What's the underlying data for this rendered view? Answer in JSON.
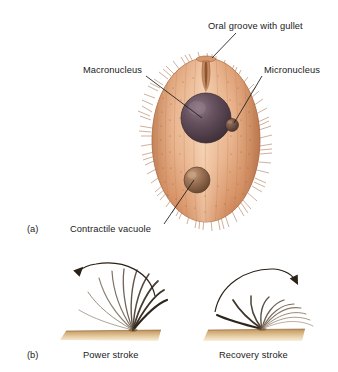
{
  "figure": {
    "background_color": "#ffffff",
    "width": 338,
    "height": 372
  },
  "panel_a": {
    "tag": "(a)",
    "subject": "paramecium-cell",
    "labels": [
      {
        "id": "oral-groove",
        "text": "Oral groove with gullet",
        "x": 208,
        "y": 28
      },
      {
        "id": "macronucleus",
        "text": "Macronucleus",
        "x": 83,
        "y": 72
      },
      {
        "id": "micronucleus",
        "text": "Micronucleus",
        "x": 264,
        "y": 72
      },
      {
        "id": "contractile-vacuole",
        "text": "Contractile vacuole",
        "x": 70,
        "y": 231
      }
    ],
    "organelles": {
      "macronucleus_color": "#574453",
      "micronucleus_color": "#6b4f45",
      "contractile_vacuole_color": "#8e6a52",
      "body_color_edge": "#c4794f",
      "body_color_center": "#eebb96",
      "cilia_color": "#b07a52"
    }
  },
  "panel_b": {
    "tag": "(b)",
    "captions": [
      {
        "id": "power-stroke",
        "text": "Power stroke",
        "x": 115,
        "y": 357
      },
      {
        "id": "recovery-stroke",
        "text": "Recovery stroke",
        "x": 256,
        "y": 357
      }
    ],
    "substrate_color": "#c2995f",
    "arrow_color": "#2a2118",
    "cilium_color": "#6e5844",
    "stroke_directions": {
      "power": "counterclockwise-leftward",
      "recovery": "clockwise-rightward"
    }
  }
}
